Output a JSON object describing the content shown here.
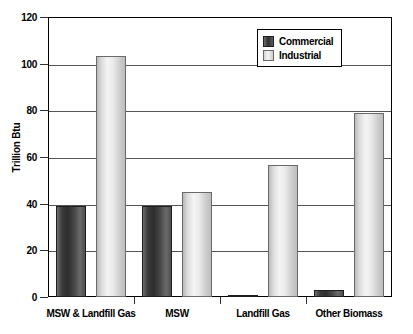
{
  "chart_data": {
    "type": "bar",
    "title": "",
    "xlabel": "",
    "ylabel": "Trillion Btu",
    "ylim": [
      0,
      120
    ],
    "yticks": [
      0,
      20,
      40,
      60,
      80,
      100,
      120
    ],
    "ytick_labels": [
      "0",
      "20",
      "40",
      "60",
      "80",
      "100",
      "120"
    ],
    "grid": true,
    "legend_position": "top-right",
    "categories": [
      "MSW & Landfill Gas",
      "MSW",
      "Landfill Gas",
      "Other Biomass"
    ],
    "series": [
      {
        "name": "Commercial",
        "color": "#3a3a3a",
        "values": [
          39,
          39,
          1,
          3
        ]
      },
      {
        "name": "Industrial",
        "color": "#e8e8e8",
        "values": [
          103.5,
          45,
          56.5,
          79
        ]
      }
    ]
  },
  "legend": {
    "entries": [
      {
        "label": "Commercial"
      },
      {
        "label": "Industrial"
      }
    ]
  },
  "axis": {
    "y_title": "Trillion Btu"
  }
}
